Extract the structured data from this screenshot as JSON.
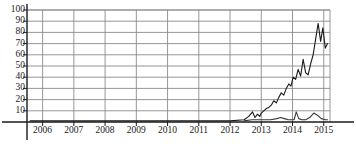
{
  "chart_data": {
    "type": "line",
    "title": "",
    "xlabel": "",
    "ylabel": "",
    "xlim": [
      2005.5,
      2015.2
    ],
    "ylim": [
      0,
      100
    ],
    "yticks": [
      10,
      20,
      30,
      40,
      50,
      60,
      70,
      80,
      90,
      100
    ],
    "xticks": [
      2006,
      2007,
      2008,
      2009,
      2010,
      2011,
      2012,
      2013,
      2014,
      2015
    ],
    "grid": true,
    "legend": "none",
    "series": [
      {
        "name": "primary",
        "color": "#1a1a1a",
        "x": [
          2005.6,
          2006.0,
          2007.0,
          2008.0,
          2009.0,
          2010.0,
          2011.0,
          2012.0,
          2012.45,
          2012.6,
          2012.72,
          2012.8,
          2012.88,
          2012.95,
          2013.0,
          2013.08,
          2013.16,
          2013.24,
          2013.32,
          2013.4,
          2013.48,
          2013.56,
          2013.64,
          2013.72,
          2013.8,
          2013.88,
          2013.95,
          2014.02,
          2014.1,
          2014.18,
          2014.26,
          2014.34,
          2014.42,
          2014.5,
          2014.58,
          2014.66,
          2014.74,
          2014.82,
          2014.9,
          2014.97,
          2015.05,
          2015.12
        ],
        "y": [
          1,
          1,
          1,
          1,
          1,
          1,
          1,
          1,
          2,
          5,
          9,
          4,
          7,
          5,
          8,
          10,
          12,
          13,
          15,
          19,
          17,
          22,
          26,
          24,
          30,
          34,
          32,
          40,
          38,
          47,
          41,
          56,
          44,
          42,
          52,
          60,
          74,
          88,
          72,
          84,
          66,
          70
        ]
      },
      {
        "name": "secondary",
        "color": "#3a3a3a",
        "x": [
          2012.45,
          2012.7,
          2012.9,
          2013.1,
          2013.3,
          2013.5,
          2013.62,
          2013.74,
          2013.86,
          2013.95,
          2014.05,
          2014.12,
          2014.2,
          2014.3,
          2014.42,
          2014.55,
          2014.68,
          2014.8,
          2014.92,
          2015.05,
          2015.12
        ],
        "y": [
          1,
          2,
          2,
          2,
          2,
          3,
          4,
          3,
          2,
          2,
          2,
          9,
          3,
          2,
          2,
          4,
          8,
          6,
          3,
          2,
          2
        ]
      }
    ]
  },
  "axis": {
    "y_tick_labels": [
      "100",
      "90",
      "80",
      "70",
      "60",
      "50",
      "40",
      "30",
      "20",
      "10"
    ],
    "x_tick_labels": [
      "2006",
      "2007",
      "2008",
      "2009",
      "2010",
      "2011",
      "2012",
      "2013",
      "2014",
      "2015"
    ]
  },
  "style": {
    "grid_color": "#8a8a8a",
    "axis_color": "#1a1a1a",
    "plot_bg": "#ffffff"
  }
}
